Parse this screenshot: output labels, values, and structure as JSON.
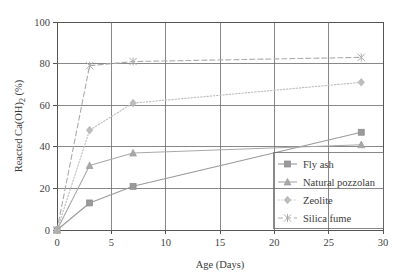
{
  "chart_data": {
    "type": "line",
    "title": "",
    "xlabel": "Age (Days)",
    "ylabel": "Reacted Ca(OH)2 (%)",
    "ylabel_parts": {
      "prefix": "Reacted Ca(OH)",
      "subscript": "2",
      "suffix": " (%)"
    },
    "xlim": [
      0,
      30
    ],
    "ylim": [
      0,
      100
    ],
    "xticks": [
      0,
      5,
      10,
      15,
      20,
      25,
      30
    ],
    "yticks": [
      0,
      20,
      40,
      60,
      80,
      100
    ],
    "xtick_labels": [
      "0",
      "5",
      "10",
      "15",
      "20",
      "25",
      "30"
    ],
    "ytick_labels": [
      "0",
      "20",
      "40",
      "60",
      "80",
      "100"
    ],
    "grid": true,
    "grid_axis": "both",
    "legend_position": "lower right",
    "x": [
      0,
      3,
      7,
      28
    ],
    "series": [
      {
        "name": "Fly ash",
        "values": [
          0,
          13,
          21,
          47
        ],
        "marker": "square",
        "linestyle": "solid",
        "color": "#9a9a9a"
      },
      {
        "name": "Natural pozzolan",
        "values": [
          0,
          31,
          37,
          41
        ],
        "marker": "triangle",
        "linestyle": "solid",
        "color": "#a8a8a8"
      },
      {
        "name": "Zeolite",
        "values": [
          0,
          48,
          61,
          71
        ],
        "marker": "diamond",
        "linestyle": "dotted",
        "color": "#bdbdbd"
      },
      {
        "name": "Silica fume",
        "values": [
          0,
          79,
          81,
          83
        ],
        "marker": "cross",
        "linestyle": "dashed",
        "color": "#ababab"
      }
    ]
  },
  "legend": {
    "entries": [
      {
        "label": "Fly ash"
      },
      {
        "label": "Natural pozzolan"
      },
      {
        "label": "Zeolite"
      },
      {
        "label": "Silica fume"
      }
    ]
  }
}
